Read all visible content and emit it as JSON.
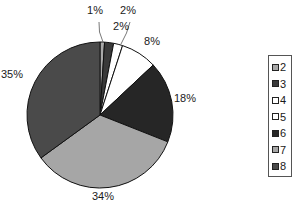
{
  "chart_data": {
    "type": "pie",
    "title": "",
    "start_angle": "12 o'clock",
    "direction": "clockwise",
    "categories": [
      "2",
      "3",
      "4",
      "5",
      "6",
      "7",
      "8"
    ],
    "values": [
      1,
      2,
      2,
      8,
      18,
      34,
      35
    ],
    "labels": [
      "1%",
      "2%",
      "2%",
      "8%",
      "18%",
      "34%",
      "35%"
    ],
    "colors": [
      "#a9a9a9",
      "#3a3a3a",
      "#ffffff",
      "#ffffff",
      "#262626",
      "#a6a6a6",
      "#4a4a4a"
    ],
    "legend": {
      "position": "right",
      "entries": [
        "2",
        "3",
        "4",
        "5",
        "6",
        "7",
        "8"
      ]
    }
  }
}
